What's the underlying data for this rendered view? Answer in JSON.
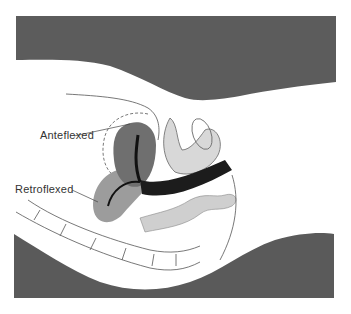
{
  "figure": {
    "type": "anatomical-cross-section",
    "labels": {
      "anteflexed": "Anteflexed",
      "retroflexed": "Retroflexed"
    },
    "colors": {
      "background_mass": "#5a5a5a",
      "body_fill": "#ffffff",
      "anteflexed_uterus": "#6e6e6e",
      "retroflexed_uterus": "#9a9a9a",
      "canal": "#1a1a1a",
      "outline": "#444444"
    }
  }
}
